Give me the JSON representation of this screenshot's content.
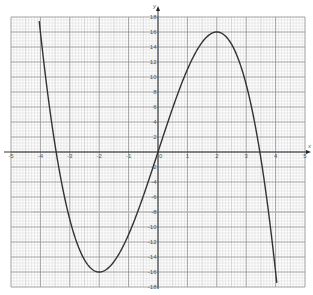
{
  "chart_data": {
    "type": "line",
    "title": "",
    "xlabel": "x",
    "ylabel": "y",
    "xlim": [
      -5,
      5
    ],
    "ylim": [
      -18,
      18
    ],
    "grid": true,
    "legend": null,
    "x_ticks": [
      "-5",
      "-4",
      "-3",
      "-2",
      "-1",
      "0",
      "1",
      "2",
      "3",
      "4",
      "5"
    ],
    "y_ticks": [
      "18",
      "16",
      "14",
      "12",
      "10",
      "8",
      "6",
      "4",
      "2",
      "-2",
      "-4",
      "-6",
      "-8",
      "-10",
      "-12",
      "-14",
      "-16",
      "-18"
    ],
    "series": [
      {
        "name": "y = -x^3 + 12x",
        "color": "#333333",
        "x": [
          -4.1,
          -4,
          -3.5,
          -3,
          -2.5,
          -2,
          -1.5,
          -1,
          -0.5,
          0,
          0.5,
          1,
          1.5,
          2,
          2.5,
          3,
          3.5,
          4,
          4.05
        ],
        "y": [
          19.7,
          16,
          0.9,
          -9,
          -14.4,
          -16,
          -14.6,
          -11,
          -5.9,
          0,
          5.9,
          11,
          14.6,
          16,
          14.4,
          9,
          -0.9,
          -16,
          -17.8
        ]
      }
    ],
    "annotations": {
      "local_max": [
        2,
        16
      ],
      "local_min": [
        -2,
        -16
      ],
      "roots": [
        -3.46,
        0,
        3.46
      ],
      "highlight_band_y": -8
    }
  },
  "colors": {
    "curve": "#333333",
    "major_grid": "#8a8a8a",
    "mid_grid": "#b4b4b4",
    "minor_grid": "#d6d6d6",
    "axis": "#222222",
    "band": "#bfbfbf"
  }
}
